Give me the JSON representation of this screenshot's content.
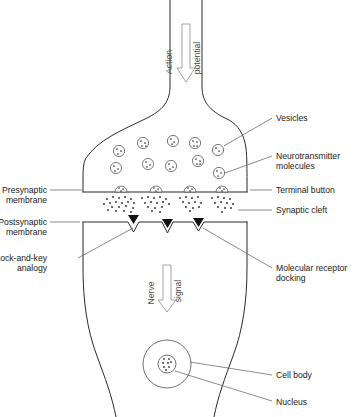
{
  "diagram": {
    "type": "biological-illustration",
    "canvas": {
      "width": 361,
      "height": 417
    },
    "colors": {
      "background": "#ffffff",
      "outline": "#2b2b2b",
      "leader_line": "#5a5a5a",
      "text": "#1a1a1a",
      "arrow_stroke": "#9a9a9a",
      "arrow_fill": "#ffffff",
      "receptor_fill": "#111111",
      "vesicle_stroke": "#4d4d4d",
      "neurotransmitter_dot": "#2e2e2e"
    }
  },
  "flow_arrows": [
    {
      "name": "action-potential",
      "words": [
        "Action",
        "potential"
      ],
      "direction": "down",
      "text_orientation": "rotated-90-ccw",
      "x": 186,
      "y_start": 24,
      "y_end": 80
    },
    {
      "name": "nerve-signal",
      "words": [
        "Nerve",
        "signal"
      ],
      "direction": "down",
      "text_orientation": "rotated-90-ccw",
      "x": 167,
      "y_start": 265,
      "y_end": 311
    }
  ],
  "labels": {
    "vesicles": {
      "text": "Vesicles",
      "side": "right",
      "x": 276,
      "y": 120,
      "lines": [
        "Vesicles"
      ]
    },
    "neurotransmitter_molecules": {
      "text": "Neurotransmitter molecules",
      "side": "right",
      "x": 276,
      "y": 157,
      "lines": [
        "Neurotransmitter",
        "molecules"
      ]
    },
    "terminal_button": {
      "text": "Terminal button",
      "side": "right",
      "x": 276,
      "y": 192,
      "lines": [
        "Terminal button"
      ]
    },
    "synaptic_cleft": {
      "text": "Synaptic cleft",
      "side": "right",
      "x": 276,
      "y": 213,
      "lines": [
        "Synaptic cleft"
      ]
    },
    "molecular_receptor_docking": {
      "text": "Molecular receptor docking",
      "side": "right",
      "x": 276,
      "y": 272,
      "lines": [
        "Molecular receptor",
        "docking"
      ]
    },
    "cell_body": {
      "text": "Cell body",
      "side": "right",
      "x": 276,
      "y": 377,
      "lines": [
        "Cell body"
      ]
    },
    "nucleus": {
      "text": "Nucleus",
      "side": "right",
      "x": 276,
      "y": 404,
      "lines": [
        "Nucleus"
      ]
    },
    "presynaptic_membrane": {
      "text": "Presynaptic membrane",
      "side": "left",
      "x": 78,
      "y": 188,
      "lines": [
        "Presynaptic",
        "membrane"
      ]
    },
    "postsynaptic_membrane": {
      "text": "Postsynaptic membrane",
      "side": "left",
      "x": 78,
      "y": 220,
      "lines": [
        "Postsynaptic",
        "membrane"
      ]
    },
    "lock_and_key_analogy": {
      "text": "Lock-and-key analogy",
      "side": "left",
      "x": 78,
      "y": 262,
      "lines": [
        "Lock-and-key",
        "analogy"
      ]
    }
  },
  "structures": {
    "presynaptic_neuron": {
      "name": "presynaptic terminal button",
      "membrane_line_y": 192,
      "left_edge_x": 83,
      "right_edge_x": 247
    },
    "postsynaptic_neuron": {
      "name": "postsynaptic cell body",
      "membrane_line_y": 222,
      "left_edge_x": 83,
      "right_edge_x": 247
    },
    "synaptic_cleft": {
      "top_y": 192,
      "bottom_y": 222,
      "height": 30
    },
    "nucleus": {
      "cx": 167,
      "cy": 364,
      "outer_r": 24,
      "inner_r": 9
    }
  },
  "vesicles": [
    {
      "cx": 119,
      "cy": 151,
      "r": 5.6
    },
    {
      "cx": 116,
      "cy": 168,
      "r": 5.6
    },
    {
      "cx": 143,
      "cy": 143,
      "r": 5.6
    },
    {
      "cx": 148,
      "cy": 164,
      "r": 5.6
    },
    {
      "cx": 173,
      "cy": 141,
      "r": 5.6
    },
    {
      "cx": 171,
      "cy": 166,
      "r": 5.6
    },
    {
      "cx": 195,
      "cy": 143,
      "r": 5.6
    },
    {
      "cx": 198,
      "cy": 161,
      "r": 5.6
    },
    {
      "cx": 218,
      "cy": 150,
      "r": 5.6
    },
    {
      "cx": 219,
      "cy": 173,
      "r": 5.6
    }
  ],
  "release_sites": [
    {
      "cx": 121,
      "cy": 190,
      "r": 6
    },
    {
      "cx": 156,
      "cy": 190,
      "r": 6
    },
    {
      "cx": 190,
      "cy": 190,
      "r": 6
    },
    {
      "cx": 222,
      "cy": 190,
      "r": 6
    }
  ],
  "receptors": [
    {
      "x": 128,
      "y": 216,
      "width": 11,
      "height": 9
    },
    {
      "x": 162,
      "y": 220,
      "width": 11,
      "height": 9
    },
    {
      "x": 193,
      "y": 219,
      "width": 11,
      "height": 9
    }
  ],
  "legend_note": "Arrows indicate direction of signal propagation from presynaptic axon through the synaptic cleft into the postsynaptic cell body."
}
